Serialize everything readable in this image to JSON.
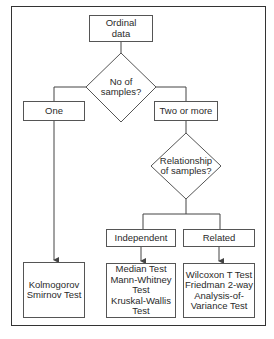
{
  "diagram": {
    "type": "flowchart",
    "start": {
      "lines": [
        "Ordinal",
        "data"
      ]
    },
    "decision_samples": {
      "lines": [
        "No of",
        "samples?"
      ]
    },
    "branch_one": {
      "label": "One"
    },
    "branch_two_or_more": {
      "label": "Two or more"
    },
    "decision_relationship": {
      "lines": [
        "Relationship",
        "of samples?"
      ]
    },
    "branch_independent": {
      "label": "Independent"
    },
    "branch_related": {
      "label": "Related"
    },
    "result_one": {
      "lines": [
        "Kolmogorov",
        "Smirnov Test"
      ]
    },
    "result_independent": {
      "lines": [
        "Median Test",
        "Mann-Whitney",
        "Test",
        "Kruskal-Wallis",
        "Test"
      ]
    },
    "result_related": {
      "lines": [
        "Wilcoxon T Test",
        "Friedman 2-way",
        "Analysis-of-",
        "Variance Test"
      ]
    },
    "colors": {
      "line": "#444444",
      "box_border": "#555555",
      "frame": "#333333",
      "background": "#ffffff"
    }
  }
}
